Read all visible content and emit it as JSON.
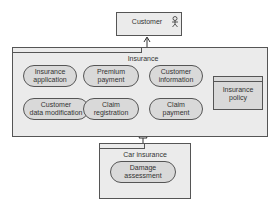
{
  "diagram": {
    "customer": {
      "label": "Customer",
      "icon": "actor-icon"
    },
    "insurance": {
      "label": "Insurance",
      "services": [
        {
          "label": "Insurance\napplication"
        },
        {
          "label": "Premium\npayment"
        },
        {
          "label": "Customer\ninformation"
        },
        {
          "label": "Customer\ndata modification"
        },
        {
          "label": "Claim\nregistration"
        },
        {
          "label": "Claim\npayment"
        }
      ],
      "object": {
        "label": "Insurance\npolicy"
      }
    },
    "car_insurance": {
      "label": "Car insurance",
      "services": [
        {
          "label": "Damage\nassessment"
        }
      ]
    },
    "colors": {
      "box_fill": "#ebebeb",
      "pill_fill": "#d9d9d9",
      "border": "#555555"
    }
  }
}
